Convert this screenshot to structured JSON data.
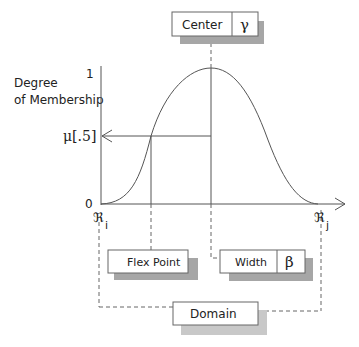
{
  "diagram": {
    "type": "fuzzy-membership-curve",
    "y_axis": {
      "label_line1": "Degree",
      "label_line2": "of Membership",
      "top_tick": "1",
      "bottom_tick": "0",
      "mid_tick": "μ[.5]"
    },
    "x_axis": {
      "left_label": "ℜ",
      "left_sub": "i",
      "right_label": "ℜ",
      "right_sub": "j"
    },
    "boxes": {
      "center": {
        "label": "Center",
        "symbol": "γ"
      },
      "flex": {
        "label": "Flex Point"
      },
      "width": {
        "label": "Width",
        "symbol": "β"
      },
      "domain": {
        "label": "Domain"
      }
    },
    "colors": {
      "line": "#555555",
      "shadow": "#a6a6a6",
      "shadow_light": "#c8c8c8",
      "box_border": "#666666"
    }
  }
}
